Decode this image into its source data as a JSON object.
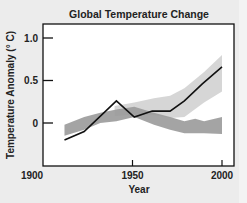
{
  "chart_data": {
    "type": "line",
    "title": "Global Temperature Change",
    "xlabel": "Year",
    "ylabel": "Temperature Anomaly (° C)",
    "xlim": [
      1900,
      2007
    ],
    "ylim": [
      -0.5,
      1.15
    ],
    "xticks": [
      1900,
      1950,
      2000
    ],
    "xtick_labels": [
      "1900",
      "1950",
      "2000"
    ],
    "yticks": [
      1.0,
      0.5,
      0
    ],
    "ytick_labels": [
      "1.0",
      "0.5",
      "0"
    ],
    "grid": false,
    "legend": null,
    "series": [
      {
        "name": "observed",
        "type": "line",
        "color": "#111111",
        "x": [
          1912,
          1923,
          1941,
          1951,
          1961,
          1971,
          1979,
          1989,
          2000
        ],
        "y": [
          -0.2,
          -0.1,
          0.26,
          0.07,
          0.14,
          0.14,
          0.26,
          0.46,
          0.66
        ]
      },
      {
        "name": "natural-and-human-forcing-band",
        "type": "band",
        "color": "#d2d2d2",
        "x": [
          1940,
          1951,
          1962,
          1971,
          1979,
          1990,
          2000
        ],
        "upper": [
          0.2,
          0.24,
          0.29,
          0.32,
          0.41,
          0.6,
          0.8
        ],
        "lower": [
          0.08,
          0.1,
          0.09,
          0.06,
          0.07,
          0.24,
          0.37
        ]
      },
      {
        "name": "natural-forcing-band",
        "type": "band",
        "color": "#9a9a9a",
        "x": [
          1912,
          1923,
          1932,
          1941,
          1951,
          1962,
          1971,
          1979,
          1985,
          1990,
          2000
        ],
        "upper": [
          -0.02,
          0.07,
          0.12,
          0.16,
          0.19,
          0.12,
          0.07,
          0.02,
          0.05,
          0.02,
          0.07
        ],
        "lower": [
          -0.15,
          -0.08,
          0.0,
          0.02,
          0.07,
          -0.02,
          -0.08,
          -0.12,
          -0.12,
          -0.12,
          -0.13
        ]
      }
    ]
  }
}
